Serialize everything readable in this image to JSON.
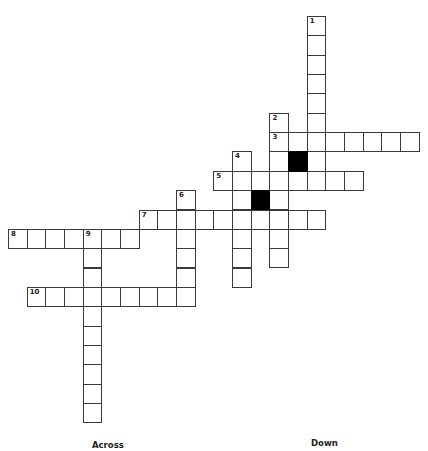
{
  "puzzle": {
    "cell_size": {
      "w": 18.67,
      "h": 19.35
    },
    "origin": {
      "x": 8,
      "y": 16
    },
    "words": [
      {
        "number": 1,
        "direction": "down",
        "row": 0,
        "col": 16,
        "length": 9
      },
      {
        "number": 2,
        "direction": "down",
        "row": 5,
        "col": 14,
        "length": 8
      },
      {
        "number": 3,
        "direction": "across",
        "row": 6,
        "col": 14,
        "length": 8
      },
      {
        "number": 4,
        "direction": "down",
        "row": 7,
        "col": 12,
        "length": 7
      },
      {
        "number": 5,
        "direction": "across",
        "row": 8,
        "col": 11,
        "length": 8
      },
      {
        "number": 6,
        "direction": "down",
        "row": 9,
        "col": 9,
        "length": 6
      },
      {
        "number": 7,
        "direction": "across",
        "row": 10,
        "col": 7,
        "length": 10
      },
      {
        "number": 8,
        "direction": "across",
        "row": 11,
        "col": 0,
        "length": 7
      },
      {
        "number": 9,
        "direction": "down",
        "row": 11,
        "col": 4,
        "length": 10
      },
      {
        "number": 10,
        "direction": "across",
        "row": 14,
        "col": 1,
        "length": 9
      }
    ],
    "black_cells": [
      {
        "row": 7,
        "col": 15
      },
      {
        "row": 9,
        "col": 13
      }
    ]
  },
  "clues": {
    "across_heading": "Across",
    "down_heading": "Down"
  }
}
